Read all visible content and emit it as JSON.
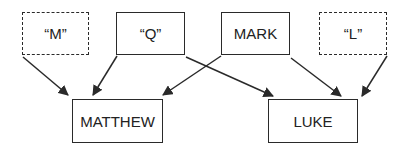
{
  "diagram": {
    "type": "synoptic-source-hypothesis",
    "nodes": [
      {
        "id": "m",
        "label": "“M”",
        "style": "dashed",
        "box": [
          22,
          12,
          67,
          43
        ]
      },
      {
        "id": "q",
        "label": "“Q”",
        "style": "solid",
        "box": [
          116,
          12,
          69,
          43
        ]
      },
      {
        "id": "mark",
        "label": "MARK",
        "style": "solid",
        "box": [
          221,
          12,
          69,
          43
        ]
      },
      {
        "id": "l",
        "label": "“L”",
        "style": "dashed",
        "box": [
          319,
          12,
          68,
          43
        ]
      },
      {
        "id": "matthew",
        "label": "MATTHEW",
        "style": "solid",
        "box": [
          72,
          99,
          91,
          44
        ]
      },
      {
        "id": "luke",
        "label": "LUKE",
        "style": "solid",
        "box": [
          268,
          99,
          90,
          44
        ]
      }
    ],
    "edges": [
      {
        "from": "m",
        "to": "matthew",
        "x1": 23,
        "y1": 57,
        "x2": 68,
        "y2": 95
      },
      {
        "from": "q",
        "to": "matthew",
        "x1": 117,
        "y1": 56,
        "x2": 93,
        "y2": 95
      },
      {
        "from": "q",
        "to": "luke",
        "x1": 186,
        "y1": 57,
        "x2": 273,
        "y2": 96
      },
      {
        "from": "mark",
        "to": "matthew",
        "x1": 221,
        "y1": 56,
        "x2": 163,
        "y2": 95
      },
      {
        "from": "mark",
        "to": "luke",
        "x1": 291,
        "y1": 58,
        "x2": 341,
        "y2": 96
      },
      {
        "from": "l",
        "to": "luke",
        "x1": 387,
        "y1": 56,
        "x2": 362,
        "y2": 96
      }
    ],
    "colors": {
      "stroke": "#2a2a2a",
      "text": "#222222",
      "background": "#ffffff"
    }
  }
}
